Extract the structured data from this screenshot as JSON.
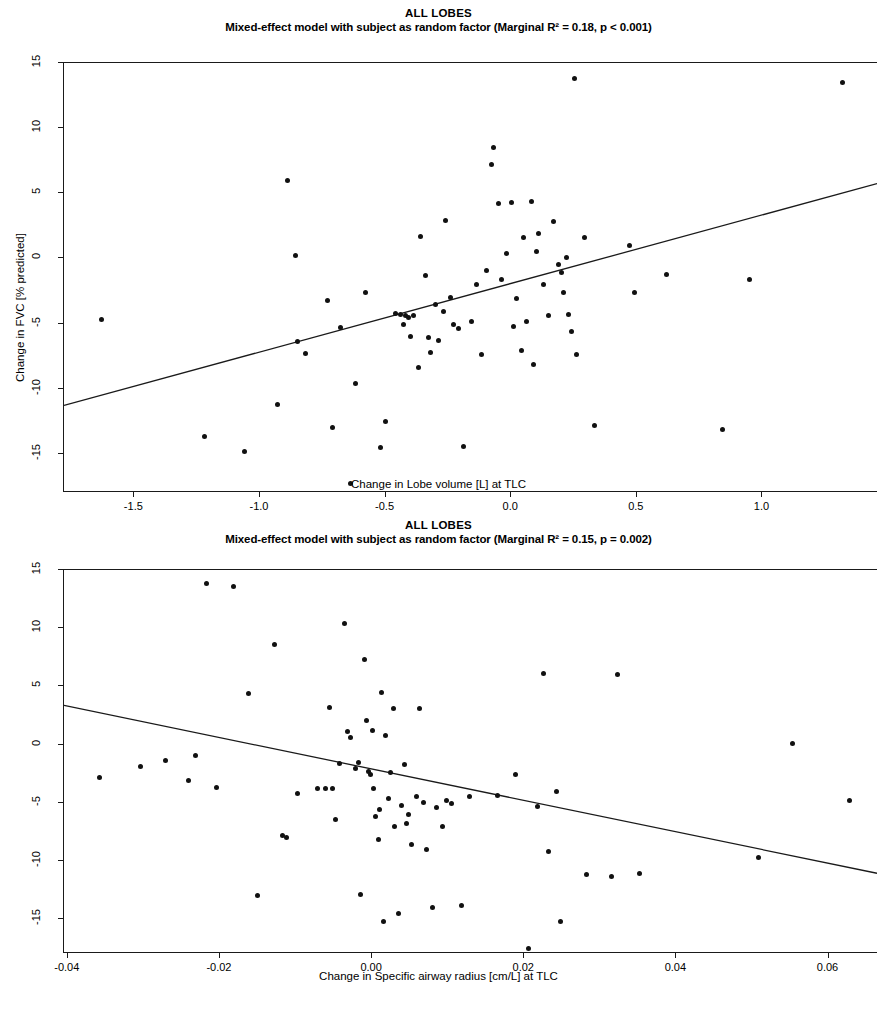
{
  "page": {
    "background": "#ffffff",
    "point_color": "#111111",
    "line_color": "#1a1a1a",
    "axis_color": "#1a1a1a"
  },
  "chart_data": [
    {
      "type": "scatter",
      "title": "ALL LOBES",
      "subtitle": "Mixed-effect model with subject as random factor (Marginal R² = 0.18, p < 0.001)",
      "stats": {
        "model": "Mixed-effect model with subject as random factor",
        "marginal_r2": 0.18,
        "p_value": "p < 0.001"
      },
      "xlabel": "Change in Lobe volume [L] at TLC",
      "ylabel": "Change in FVC [% predicted]",
      "xlim": [
        -1.78,
        1.46
      ],
      "ylim": [
        -18.0,
        15.0
      ],
      "xticks": [
        -1.5,
        -1.0,
        -0.5,
        0.0,
        0.5,
        1.0
      ],
      "xticklabels": [
        "-1.5",
        "-1.0",
        "-0.5",
        "0.0",
        "0.5",
        "1.0"
      ],
      "yticks": [
        -15,
        -10,
        -5,
        0,
        5,
        10,
        15
      ],
      "yticklabels": [
        "-15",
        "-10",
        "-5",
        "0",
        "5",
        "10",
        "15"
      ],
      "grid": false,
      "legend": "none",
      "trendline": {
        "x": [
          -1.78,
          1.46
        ],
        "y": [
          -11.4,
          5.7
        ],
        "slope": 5.28,
        "intercept": -2.0
      },
      "points": [
        [
          -1.63,
          -4.7
        ],
        [
          -1.22,
          -13.7
        ],
        [
          -1.06,
          -14.8
        ],
        [
          -0.89,
          6.0
        ],
        [
          -0.93,
          -11.2
        ],
        [
          -0.86,
          0.2
        ],
        [
          -0.85,
          -6.4
        ],
        [
          -0.82,
          -7.3
        ],
        [
          -0.73,
          -3.2
        ],
        [
          -0.71,
          -13.0
        ],
        [
          -0.68,
          -5.3
        ],
        [
          -0.64,
          -17.3
        ],
        [
          -0.62,
          -9.6
        ],
        [
          -0.58,
          -2.6
        ],
        [
          -0.52,
          -14.5
        ],
        [
          -0.5,
          -12.5
        ],
        [
          -0.46,
          -4.2
        ],
        [
          -0.44,
          -4.3
        ],
        [
          -0.43,
          -5.1
        ],
        [
          -0.42,
          -4.4
        ],
        [
          -0.41,
          -4.5
        ],
        [
          -0.4,
          -6.0
        ],
        [
          -0.39,
          -4.4
        ],
        [
          -0.37,
          -8.4
        ],
        [
          -0.36,
          1.7
        ],
        [
          -0.34,
          -1.3
        ],
        [
          -0.33,
          -6.1
        ],
        [
          -0.32,
          -7.2
        ],
        [
          -0.3,
          -3.5
        ],
        [
          -0.29,
          -6.3
        ],
        [
          -0.27,
          -4.1
        ],
        [
          -0.26,
          2.9
        ],
        [
          -0.24,
          -3.0
        ],
        [
          -0.23,
          -5.1
        ],
        [
          -0.21,
          -5.4
        ],
        [
          -0.19,
          -14.4
        ],
        [
          -0.16,
          -4.8
        ],
        [
          -0.14,
          -2.0
        ],
        [
          -0.12,
          -7.4
        ],
        [
          -0.1,
          -0.9
        ],
        [
          -0.08,
          7.2
        ],
        [
          -0.07,
          8.5
        ],
        [
          -0.05,
          4.2
        ],
        [
          -0.04,
          -1.6
        ],
        [
          -0.02,
          0.4
        ],
        [
          0.0,
          4.3
        ],
        [
          0.01,
          -5.2
        ],
        [
          0.02,
          -3.1
        ],
        [
          0.04,
          -7.1
        ],
        [
          0.05,
          1.6
        ],
        [
          0.06,
          -4.8
        ],
        [
          0.08,
          4.4
        ],
        [
          0.09,
          -8.1
        ],
        [
          0.1,
          0.5
        ],
        [
          0.11,
          1.9
        ],
        [
          0.13,
          -2.0
        ],
        [
          0.15,
          -4.4
        ],
        [
          0.17,
          2.8
        ],
        [
          0.19,
          -0.5
        ],
        [
          0.2,
          -1.1
        ],
        [
          0.21,
          -2.6
        ],
        [
          0.22,
          0.1
        ],
        [
          0.23,
          -4.3
        ],
        [
          0.24,
          -5.6
        ],
        [
          0.25,
          13.8
        ],
        [
          0.26,
          -7.4
        ],
        [
          0.29,
          1.6
        ],
        [
          0.33,
          -12.8
        ],
        [
          0.47,
          1.0
        ],
        [
          0.49,
          -2.6
        ],
        [
          0.62,
          -1.2
        ],
        [
          0.84,
          -13.1
        ],
        [
          0.95,
          -1.6
        ],
        [
          1.32,
          13.5
        ]
      ]
    },
    {
      "type": "scatter",
      "title": "ALL LOBES",
      "subtitle": "Mixed-effect model with subject as random factor (Marginal R² = 0.15, p = 0.002)",
      "stats": {
        "model": "Mixed-effect model with subject as random factor",
        "marginal_r2": 0.15,
        "p_value": "p = 0.002"
      },
      "xlabel": "Change in Specific airway radius [cm/L] at TLC",
      "ylabel": "Change in FVC [% predicted]",
      "xlim": [
        -0.0405,
        0.0665
      ],
      "ylim": [
        -18.0,
        15.0
      ],
      "xticks": [
        -0.04,
        -0.02,
        0.0,
        0.02,
        0.04,
        0.06
      ],
      "xticklabels": [
        "-0.04",
        "-0.02",
        "0.00",
        "0.02",
        "0.04",
        "0.06"
      ],
      "yticks": [
        -15,
        -10,
        -5,
        0,
        5,
        10,
        15
      ],
      "yticklabels": [
        "-15",
        "-10",
        "-5",
        "0",
        "5",
        "10",
        "15"
      ],
      "grid": false,
      "legend": "none",
      "trendline": {
        "x": [
          -0.0405,
          0.0665
        ],
        "y": [
          3.3,
          -11.2
        ],
        "slope": -135.5,
        "intercept": -2.2
      },
      "points": [
        [
          -0.0358,
          -2.8
        ],
        [
          -0.0305,
          -1.9
        ],
        [
          -0.0272,
          -1.4
        ],
        [
          -0.0242,
          -3.1
        ],
        [
          -0.0232,
          -0.9
        ],
        [
          -0.0218,
          13.8
        ],
        [
          -0.0205,
          -3.7
        ],
        [
          -0.0182,
          13.6
        ],
        [
          -0.0162,
          4.4
        ],
        [
          -0.0151,
          -13.0
        ],
        [
          -0.0128,
          8.6
        ],
        [
          -0.0118,
          -7.8
        ],
        [
          -0.0112,
          -8.0
        ],
        [
          -0.0098,
          -4.2
        ],
        [
          -0.0072,
          -3.8
        ],
        [
          -0.0061,
          -3.8
        ],
        [
          -0.0056,
          3.2
        ],
        [
          -0.0052,
          -3.8
        ],
        [
          -0.0048,
          -6.4
        ],
        [
          -0.0043,
          -1.6
        ],
        [
          -0.0036,
          10.4
        ],
        [
          -0.0032,
          1.1
        ],
        [
          -0.0028,
          0.6
        ],
        [
          -0.0022,
          -2.1
        ],
        [
          -0.0018,
          -1.5
        ],
        [
          -0.0015,
          -12.9
        ],
        [
          -0.001,
          7.3
        ],
        [
          -0.0008,
          2.1
        ],
        [
          -0.0005,
          -2.3
        ],
        [
          -0.0002,
          -2.6
        ],
        [
          0.0,
          1.2
        ],
        [
          0.0002,
          -3.8
        ],
        [
          0.0005,
          -6.2
        ],
        [
          0.0008,
          -8.2
        ],
        [
          0.001,
          -5.6
        ],
        [
          0.0012,
          4.5
        ],
        [
          0.0015,
          -15.2
        ],
        [
          0.0018,
          0.8
        ],
        [
          0.0022,
          -4.6
        ],
        [
          0.0024,
          -2.4
        ],
        [
          0.0028,
          3.1
        ],
        [
          0.003,
          -7.0
        ],
        [
          0.0035,
          -14.5
        ],
        [
          0.0038,
          -5.2
        ],
        [
          0.0042,
          -1.7
        ],
        [
          0.0045,
          -6.8
        ],
        [
          0.0048,
          -6.0
        ],
        [
          0.0052,
          -8.6
        ],
        [
          0.0058,
          -4.5
        ],
        [
          0.0062,
          3.1
        ],
        [
          0.0068,
          -5.0
        ],
        [
          0.0072,
          -9.0
        ],
        [
          0.008,
          -14.0
        ],
        [
          0.0085,
          -5.4
        ],
        [
          0.0092,
          -7.0
        ],
        [
          0.0098,
          -4.8
        ],
        [
          0.0105,
          -5.1
        ],
        [
          0.0118,
          -13.8
        ],
        [
          0.0128,
          -4.5
        ],
        [
          0.0165,
          -4.4
        ],
        [
          0.0188,
          -2.6
        ],
        [
          0.0205,
          -17.5
        ],
        [
          0.0218,
          -5.3
        ],
        [
          0.0225,
          6.1
        ],
        [
          0.0232,
          -9.2
        ],
        [
          0.0242,
          -4.0
        ],
        [
          0.0248,
          -15.2
        ],
        [
          0.0282,
          -11.2
        ],
        [
          0.0315,
          -11.3
        ],
        [
          0.0322,
          6.0
        ],
        [
          0.0352,
          -11.1
        ],
        [
          0.0508,
          -9.7
        ],
        [
          0.0552,
          0.1
        ],
        [
          0.0628,
          -4.8
        ]
      ]
    }
  ]
}
